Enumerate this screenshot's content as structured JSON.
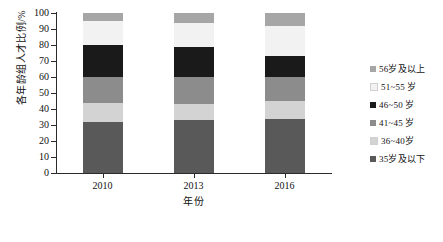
{
  "chart_data": {
    "type": "bar",
    "subtype": "stacked-column-100",
    "title": "",
    "xlabel": "年份",
    "ylabel": "各年龄组人才比例/%",
    "categories": [
      "2010",
      "2013",
      "2016"
    ],
    "ylim": [
      0,
      100
    ],
    "yticks": [
      0,
      10,
      20,
      30,
      40,
      50,
      60,
      70,
      80,
      90,
      100
    ],
    "grid": false,
    "legend_position": "right",
    "stack_order_bottom_to_top": [
      "35岁及以下",
      "36~40岁",
      "41~45 岁",
      "46~50 岁",
      "51~55 岁",
      "56岁及以上"
    ],
    "series": [
      {
        "name": "35岁及以下",
        "color": "#595959",
        "values": [
          32,
          33,
          34
        ]
      },
      {
        "name": "36~40岁",
        "color": "#d3d3d3",
        "values": [
          12,
          10,
          11
        ]
      },
      {
        "name": "41~45 岁",
        "color": "#8c8c8c",
        "values": [
          16,
          17,
          15
        ]
      },
      {
        "name": "46~50 岁",
        "color": "#1a1a1a",
        "values": [
          20,
          19,
          13
        ]
      },
      {
        "name": "51~55 岁",
        "color": "#f2f2f2",
        "values": [
          15,
          15,
          19
        ]
      },
      {
        "name": "56岁及以上",
        "color": "#a6a6a6",
        "values": [
          5,
          6,
          8
        ]
      }
    ]
  },
  "axes": {
    "y_title": "各年龄组人才比例/%",
    "x_title": "年份",
    "y_tick_labels": [
      "100",
      "90",
      "80",
      "70",
      "60",
      "50",
      "40",
      "30",
      "20",
      "10",
      "0"
    ],
    "x_tick_labels": [
      "2010",
      "2013",
      "2016"
    ]
  },
  "legend": {
    "items": [
      {
        "label": "56岁及以上",
        "color": "#a6a6a6"
      },
      {
        "label": "51~55 岁",
        "color": "#f2f2f2"
      },
      {
        "label": "46~50 岁",
        "color": "#1a1a1a"
      },
      {
        "label": "41~45 岁",
        "color": "#8c8c8c"
      },
      {
        "label": "36~40岁",
        "color": "#d3d3d3"
      },
      {
        "label": "35岁及以下",
        "color": "#595959"
      }
    ]
  },
  "style": {
    "axis_color": "#2b2b2b",
    "background": "#ffffff"
  }
}
